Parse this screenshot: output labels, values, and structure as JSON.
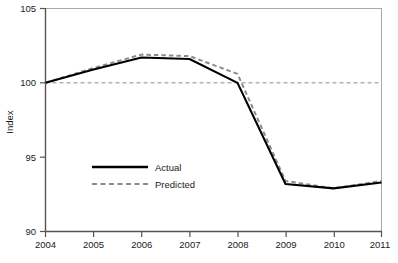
{
  "chart_data": {
    "type": "line",
    "title": "",
    "subtitle": "",
    "xlabel": "",
    "ylabel": "Index",
    "x": [
      2004,
      2005,
      2006,
      2007,
      2008,
      2009,
      2010,
      2011
    ],
    "categories": [
      "2004",
      "2005",
      "2006",
      "2007",
      "2008",
      "2009",
      "2010",
      "2011"
    ],
    "xlim": [
      2004,
      2011
    ],
    "ylim": [
      90,
      105
    ],
    "yticks": [
      90,
      95,
      100,
      105
    ],
    "ytick_labels": [
      "90",
      "95",
      "100",
      "105"
    ],
    "xticks": [
      2004,
      2005,
      2006,
      2007,
      2008,
      2009,
      2010,
      2011
    ],
    "xtick_labels": [
      "2004",
      "2005",
      "2006",
      "2007",
      "2008",
      "2009",
      "2010",
      "2011"
    ],
    "grid": false,
    "reference_line": {
      "value": 100,
      "style": "dashed",
      "color": "#8c8c8c",
      "label": ""
    },
    "legend": {
      "position": "center-left",
      "entries": [
        {
          "name": "Actual",
          "style": "solid",
          "color": "#000000"
        },
        {
          "name": "Predicted",
          "style": "dashed",
          "color": "#8c8c8c"
        }
      ]
    },
    "series": [
      {
        "name": "Actual",
        "style": "solid",
        "color": "#000000",
        "values": [
          100.0,
          100.9,
          101.7,
          101.6,
          100.0,
          93.2,
          92.9,
          93.3
        ]
      },
      {
        "name": "Predicted",
        "style": "dashed",
        "color": "#8c8c8c",
        "values": [
          100.0,
          101.0,
          101.9,
          101.8,
          100.6,
          93.4,
          92.9,
          93.4
        ]
      }
    ]
  },
  "axes": {
    "y_title": "Index",
    "y_ticks": [
      "105",
      "100",
      "95",
      "90"
    ],
    "x_ticks": [
      "2004",
      "2005",
      "2006",
      "2007",
      "2008",
      "2009",
      "2010",
      "2011"
    ]
  },
  "legend": {
    "actual_label": "Actual",
    "predicted_label": "Predicted"
  },
  "colors": {
    "actual": "#000000",
    "predicted": "#8c8c8c",
    "frame": "#999999",
    "text": "#1a1a1a"
  }
}
